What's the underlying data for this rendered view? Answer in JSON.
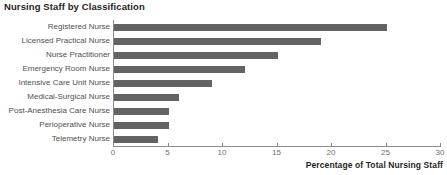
{
  "chart_data": {
    "type": "bar",
    "orientation": "horizontal",
    "title": "Nursing Staff by Classification",
    "xlabel": "Percentage of Total Nursing Staff",
    "ylabel": "",
    "categories": [
      "Registered Nurse",
      "Licensed Practical Nurse",
      "Nurse Practitioner",
      "Emergency Room Nurse",
      "Intensive Care Unit Nurse",
      "Medical-Surgical Nurse",
      "Post-Anesthesia Care Nurse",
      "Perioperative Nurse",
      "Telemetry Nurse"
    ],
    "values": [
      25,
      19,
      15,
      12,
      9,
      6,
      5,
      5,
      4
    ],
    "xlim": [
      0,
      30
    ],
    "xticks": [
      0,
      5,
      10,
      15,
      20,
      25,
      30
    ],
    "xtick_labels": [
      "0",
      "5",
      "10",
      "15",
      "20",
      "25",
      "30"
    ],
    "grid": false,
    "legend": false,
    "bar_color": "#636363",
    "axis_color": "#8c8c8c",
    "title_color": "#1f1f1f",
    "tick_label_color": "#6e6e6e",
    "category_label_color": "#4f4f4f"
  }
}
